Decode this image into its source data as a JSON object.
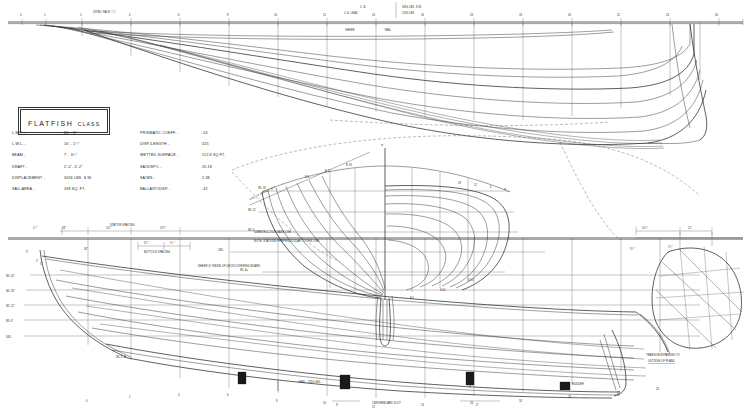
{
  "drawing": {
    "title": "FLATFISH",
    "subtitle": "CLASS",
    "type": "lines-plan"
  },
  "header": {
    "cb_label": "C. B.",
    "cb_value": "3094 LBS. S.W.",
    "cg_label": "C.G. LEAD",
    "cg_value": "1290 LBS"
  },
  "specs_left": [
    {
      "key": "L.B.P. -",
      "value": "20' - 3\""
    },
    {
      "key": "L.W.L. -",
      "value": "16' - 1½\""
    },
    {
      "key": "BEAM -",
      "value": "7' - 6½\""
    },
    {
      "key": "DRAFT -",
      "value": "2'-0\",  4'-2\""
    },
    {
      "key": "DISPLACEMENT -",
      "value": "3094 LBS. S.W."
    },
    {
      "key": "SAIL AREA -",
      "value": "268 SQ. FT."
    }
  ],
  "specs_right": [
    {
      "key": "PRISMATIC COEFF. -",
      "value": ".54"
    },
    {
      "key": "DISP./LENGTH -",
      "value": "325"
    },
    {
      "key": "WETTED SURFACE -",
      "value": "112.8 SQ.FT."
    },
    {
      "key": "SA/DISP⅔ -",
      "value": "20.18"
    },
    {
      "key": "SA/WS -",
      "value": "2.38"
    },
    {
      "key": "BALLAST/DISP. -",
      "value": ".42"
    }
  ],
  "annotations": {
    "station_spacing": "STATION SPACING",
    "buttock_spacing": "BUTTOCK SPACING",
    "construction_base_line": "CONSTRUCTION BASE LINE",
    "base_line_note": "NOTE: STATIONS PERPENDICULAR TO THIS LINE",
    "sheer_note": "SHEER @ INSIDE OF DECK/COVERING BOARD",
    "transom_note_1": "TRANSOM EXPANDED TO",
    "transom_note_2": "OUTSIDE OF PLANK",
    "lead_note": "LEAD - 1290 LBS.",
    "centerboard_slot": "CENTERBOARD  SLOT",
    "rudder": "RUDDER",
    "mast_note": "(STBD. FACE ¾\")",
    "sheer_top": "SHEER",
    "rail_top": "RAIL"
  },
  "waterlines_profile": [
    {
      "label": "WL 24\""
    },
    {
      "label": "WL 18\""
    },
    {
      "label": "WL 12\""
    },
    {
      "label": "WL 6\""
    },
    {
      "label": "LWL"
    },
    {
      "label": "WL 6\" A"
    }
  ],
  "waterlines_body": [
    {
      "label": "WL 18"
    },
    {
      "label": "WL 12"
    },
    {
      "label": "WL 6"
    },
    {
      "label": "LWL"
    },
    {
      "label": "WL 6a"
    }
  ],
  "body_plan": {
    "centerline_label": "℄",
    "diag_label": "LINE OF RABBET @ ℄",
    "buttocks": [
      "B 6",
      "B 12",
      "B 18",
      "B 24"
    ],
    "offsets": [
      "6.30",
      "6.00",
      "8.0"
    ]
  },
  "station_numbers_top": [
    "0",
    "2",
    "4",
    "6",
    "8",
    "10",
    "12",
    "14",
    "16",
    "18",
    "20",
    "22",
    "24",
    "26"
  ],
  "station_numbers_bottom": [
    "0",
    "2",
    "4",
    "6",
    "8",
    "10",
    "12",
    "14",
    "16",
    "18",
    "20",
    "22",
    "24"
  ],
  "dimensions": {
    "d1": "1½\"",
    "d2": "18\"",
    "d3": "15¼\"",
    "d4": "15¼\"",
    "d5": "5¼\"",
    "d6": "5½\"",
    "d7": "30\"",
    "d8": "5\"",
    "d9": "10¾\"",
    "d10": "12\"",
    "d11": "3¾\"",
    "d12": "1¼\"",
    "d13": "9\"",
    "d14": "4\"",
    "d15": "1¾\""
  },
  "colors": {
    "ink": "#1a1a1a",
    "line": "#262626",
    "grid": "#4a4a4a",
    "paper": "#ffffff"
  }
}
